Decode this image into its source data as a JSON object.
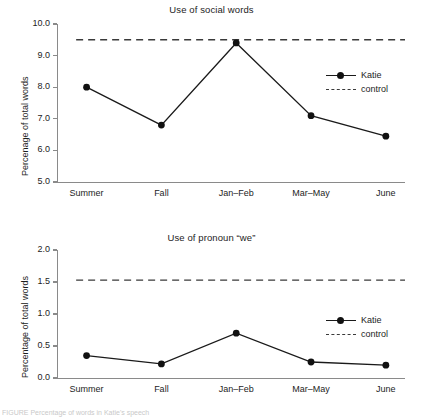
{
  "figure": {
    "background_color": "#ffffff",
    "ink_color": "#1a1a1a",
    "axis_color": "#8a8a8a",
    "caption_fragment": "FIGURE  Percentage of  words  in Katie's  speech"
  },
  "chart_data": [
    {
      "type": "line",
      "title": "Use of social words",
      "xlabel": "",
      "ylabel": "Percenage of total words",
      "categories": [
        "Summer",
        "Fall",
        "Jan–Feb",
        "Mar–May",
        "June"
      ],
      "ylim": [
        5.0,
        10.0
      ],
      "yticks": [
        5.0,
        6.0,
        7.0,
        8.0,
        9.0,
        10.0
      ],
      "ytick_labels": [
        "5.0",
        "6.0",
        "7.0",
        "8.0",
        "9.0",
        "10.0"
      ],
      "grid": false,
      "legend_position": "right",
      "series": [
        {
          "name": "Katie",
          "style": "solid-with-markers",
          "color": "#1a1a1a",
          "values": [
            8.0,
            6.8,
            9.4,
            7.1,
            6.45
          ]
        },
        {
          "name": "control",
          "style": "dashed-reference-line",
          "color": "#3a3a3a",
          "value": 9.5
        }
      ]
    },
    {
      "type": "line",
      "title": "Use of pronoun “we”",
      "xlabel": "",
      "ylabel": "Percentage of total words",
      "categories": [
        "Summer",
        "Fall",
        "Jan–Feb",
        "Mar–May",
        "June"
      ],
      "ylim": [
        0.0,
        2.0
      ],
      "yticks": [
        0.0,
        0.5,
        1.0,
        1.5,
        2.0
      ],
      "ytick_labels": [
        "0.0",
        "0.5",
        "1.0",
        "1.5",
        "2.0"
      ],
      "grid": false,
      "legend_position": "right",
      "series": [
        {
          "name": "Katie",
          "style": "solid-with-markers",
          "color": "#1a1a1a",
          "values": [
            0.35,
            0.22,
            0.7,
            0.25,
            0.2
          ]
        },
        {
          "name": "control",
          "style": "dashed-reference-line",
          "color": "#3a3a3a",
          "value": 1.53
        }
      ]
    }
  ]
}
